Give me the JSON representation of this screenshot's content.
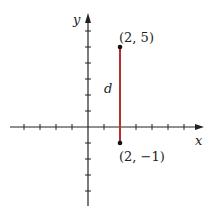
{
  "diagram": {
    "type": "coordinate-plane",
    "axes": {
      "x_label": "x",
      "y_label": "y",
      "unit_px": 16,
      "origin_px": [
        88,
        127
      ],
      "x_ticks": [
        -4,
        -3,
        -2,
        -1,
        1,
        2,
        3,
        4,
        5,
        6
      ],
      "y_ticks": [
        -5,
        -4,
        -3,
        -2,
        -1,
        1,
        2,
        3,
        4,
        5,
        6
      ]
    },
    "points": [
      {
        "label": "(2, 5)",
        "x": 2,
        "y": 5
      },
      {
        "label": "(2, −1)",
        "x": 2,
        "y": -1
      }
    ],
    "segment": {
      "label": "d",
      "from": [
        2,
        5
      ],
      "to": [
        2,
        -1
      ],
      "color": "#b5312e"
    },
    "colors": {
      "axis": "#222222",
      "segment": "#b5312e",
      "point": "#111111"
    }
  }
}
